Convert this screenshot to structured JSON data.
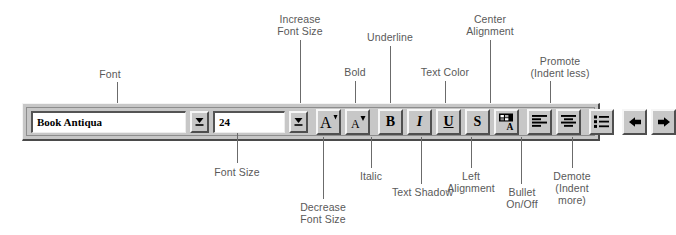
{
  "toolbar": {
    "font_name": {
      "value": "Book Antiqua",
      "dropdown_icon": "chevron-down-icon"
    },
    "font_size": {
      "value": "24",
      "dropdown_icon": "chevron-down-icon"
    },
    "buttons": [
      {
        "id": "increase-font-size",
        "icon": "increase-font-size-icon",
        "glyph": "A"
      },
      {
        "id": "decrease-font-size",
        "icon": "decrease-font-size-icon",
        "glyph": "A"
      },
      {
        "id": "bold",
        "icon": "bold-icon",
        "glyph": "B"
      },
      {
        "id": "italic",
        "icon": "italic-icon",
        "glyph": "I"
      },
      {
        "id": "underline",
        "icon": "underline-icon",
        "glyph": "U"
      },
      {
        "id": "text-shadow",
        "icon": "text-shadow-icon",
        "glyph": "S"
      },
      {
        "id": "text-color",
        "icon": "text-color-icon",
        "glyph": "A"
      },
      {
        "id": "left-alignment",
        "icon": "align-left-icon",
        "glyph": ""
      },
      {
        "id": "center-alignment",
        "icon": "align-center-icon",
        "glyph": ""
      },
      {
        "id": "bullet-on-off",
        "icon": "bulleted-list-icon",
        "glyph": ""
      },
      {
        "id": "promote",
        "icon": "arrow-left-icon",
        "glyph": ""
      },
      {
        "id": "demote",
        "icon": "arrow-right-icon",
        "glyph": ""
      }
    ]
  },
  "callouts": {
    "font": "Font",
    "increase_font_size": "Increase\nFont Size",
    "underline": "Underline",
    "center_alignment": "Center\nAlignment",
    "bold": "Bold",
    "text_color": "Text Color",
    "promote": "Promote\n(Indent less)",
    "font_size": "Font Size",
    "italic": "Italic",
    "left_alignment": "Left\nAlignment",
    "decrease_font_size": "Decrease\nFont Size",
    "text_shadow": "Text Shadow",
    "bullet_on_off": "Bullet\nOn/Off",
    "demote": "Demote\n(Indent\nmore)"
  },
  "colors": {
    "toolbar_face": "#c7c7c7",
    "field_background": "#ffffff",
    "label_text": "#595959",
    "leader_line": "#6b6b6b",
    "glyph": "#000000"
  }
}
